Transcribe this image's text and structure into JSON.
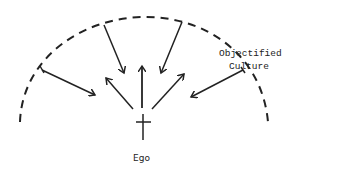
{
  "diagram": {
    "labels": {
      "outer_line1": "Objectified",
      "outer_line2": "Culture",
      "center": "Ego"
    },
    "colors": {
      "stroke": "#222222",
      "background": "#ffffff"
    },
    "elements": {
      "outer_boundary": "dashed semicircular arc representing Objectified Culture",
      "inward_arrows": 4,
      "outward_arrows": 4,
      "center_symbol": "cross"
    }
  }
}
